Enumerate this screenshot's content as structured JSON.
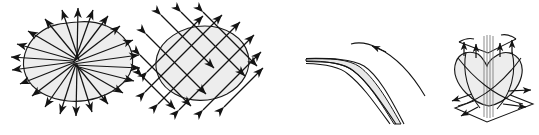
{
  "figure": {
    "title": "",
    "background_color": "#ffffff",
    "width": 539,
    "height": 135,
    "line_color": "#141414",
    "fill_color": "#ededed",
    "panel_count": 4,
    "panels": [
      {
        "index": 1,
        "name": "radial-focus-blob",
        "description": "Irregular closed blob with straight rays converging to a focal point near the center and arrowheads pointing outward all around the boundary",
        "shape": "irregular-blob",
        "ray_count": 22,
        "focus": {
          "x": 75,
          "y": 62
        },
        "arrow_direction": "outward",
        "label": ""
      },
      {
        "index": 2,
        "name": "crosshatched-blob",
        "description": "Oval blob crossed by two families of parallel straight lines forming a diamond lattice, arrowheads on both ends of every line pointing outward",
        "shape": "oval-blob",
        "family_a_count": 5,
        "family_b_count": 5,
        "arrow_direction": "outward-both-ends",
        "label": ""
      },
      {
        "index": 3,
        "name": "curved-band-fold",
        "description": "Thin horizontal band at left that bends downward to the right, thickening into a curved ribbon, with a separate outer arc carrying an arrowhead",
        "shape": "curved-ribbon",
        "arrow_direction": "along-curve",
        "label": ""
      },
      {
        "index": 4,
        "name": "heart-surface-on-plane",
        "description": "Three dimensional heart or saddle shaped surface standing on a perspective ground plane, vertical rays through its core, arrows entering from the folded sheet above and arrows radiating outward along the plane",
        "shape": "heart-solid",
        "upward_arrow_count": 4,
        "outward_arrow_count": 4,
        "arrow_direction": "up-into-surface-and-outward-on-plane",
        "label": ""
      }
    ]
  }
}
